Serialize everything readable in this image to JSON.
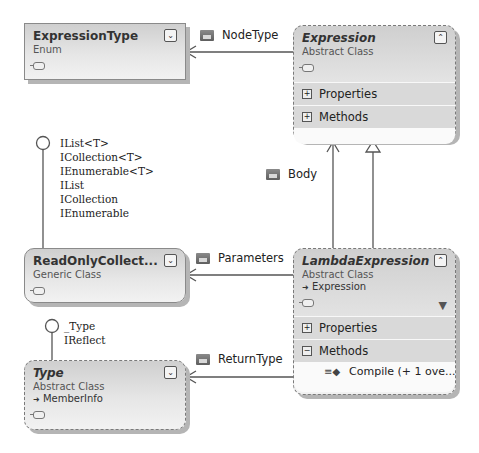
{
  "diagram": {
    "type": "class-diagram",
    "shapes": {
      "expression_type": {
        "name": "ExpressionType",
        "kind": "Enum",
        "toggle": "expand"
      },
      "expression": {
        "name": "Expression",
        "kind": "Abstract Class",
        "toggle": "collapse",
        "sections": [
          {
            "label": "Properties",
            "state": "+"
          },
          {
            "label": "Methods",
            "state": "+"
          }
        ]
      },
      "read_only_collection": {
        "name": "ReadOnlyCollect...",
        "kind": "Generic Class",
        "toggle": "expand"
      },
      "lambda_expression": {
        "name": "LambdaExpression",
        "kind": "Abstract Class",
        "base": "Expression",
        "toggle": "collapse",
        "sections": [
          {
            "label": "Properties",
            "state": "+"
          },
          {
            "label": "Methods",
            "state": "−"
          }
        ],
        "members": [
          {
            "label": "Compile (+ 1 ove..."
          }
        ]
      },
      "type": {
        "name": "Type",
        "kind": "Abstract Class",
        "base": "MemberInfo",
        "toggle": "expand"
      }
    },
    "associations": {
      "node_type": "NodeType",
      "body": "Body",
      "parameters": "Parameters",
      "return_type": "ReturnType"
    },
    "interfaces": {
      "read_only_collection": [
        "IList<T>",
        "ICollection<T>",
        "IEnumerable<T>",
        "IList",
        "ICollection",
        "IEnumerable"
      ],
      "type": [
        "_Type",
        "IReflect"
      ]
    },
    "icons": {
      "expand": "⌄",
      "collapse": "⌃",
      "base_arrow": "➜",
      "method": "≡◆",
      "filter": "▼"
    }
  }
}
